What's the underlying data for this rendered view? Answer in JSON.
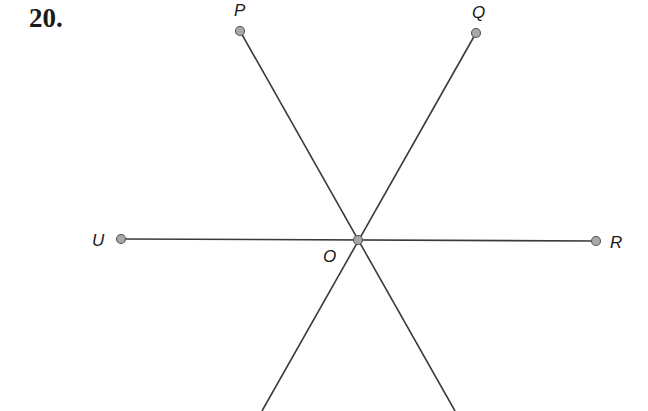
{
  "problem": {
    "number": "20."
  },
  "diagram": {
    "center": {
      "label": "O",
      "x": 358,
      "y": 240
    },
    "points": [
      {
        "label": "P",
        "x": 240,
        "y": 31
      },
      {
        "label": "Q",
        "x": 476,
        "y": 33
      },
      {
        "label": "U",
        "x": 121,
        "y": 239
      },
      {
        "label": "R",
        "x": 596,
        "y": 241
      }
    ],
    "rays_to_edge": [
      {
        "from": "O",
        "to_x": 262,
        "to_y": 411
      },
      {
        "from": "O",
        "to_x": 455,
        "to_y": 411
      }
    ],
    "colors": {
      "line": "#3a3a3a",
      "point_fill": "#a8a8a8",
      "point_stroke": "#555555"
    }
  }
}
